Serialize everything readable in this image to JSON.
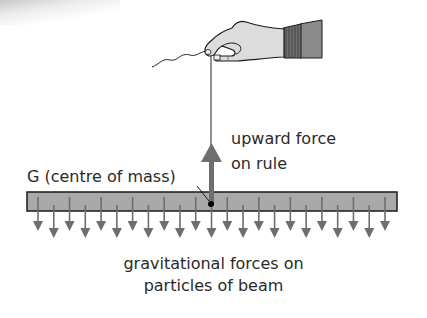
{
  "diagram": {
    "labels": {
      "centre_of_mass": "G (centre of mass)",
      "upward_force_line1": "upward force",
      "upward_force_line2": "on rule",
      "gravity_line1": "gravitational forces on",
      "gravity_line2": "particles of beam"
    },
    "objects": {
      "hand": "hand-holding-string",
      "string": "string",
      "beam": "rule (beam)",
      "upward_arrow": "upward force arrow",
      "gravity_arrows_count": 23,
      "centre_point": "G"
    },
    "colors": {
      "beam_fill": "#a9a9a9",
      "beam_border": "#1a1a1a",
      "arrow": "#6e6e6e",
      "text": "#2a2a2a",
      "hand_fill": "#d9d9d9",
      "sleeve_fill": "#8a8a8a"
    }
  }
}
